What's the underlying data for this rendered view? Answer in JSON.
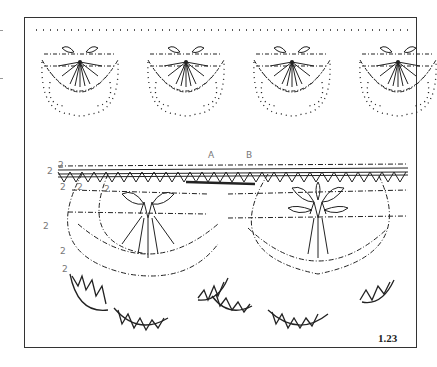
{
  "figure": {
    "number": "1.23"
  },
  "diagram": {
    "point_labels": [
      "A",
      "B"
    ],
    "pair_labels": [
      "2",
      "2",
      "2",
      "2",
      "2",
      "2",
      "2",
      "2"
    ],
    "motif_count_top": 4,
    "motif_count_bottom": 2
  },
  "colors": {
    "line": "#222222",
    "label": "#777777",
    "frame": "#333333"
  }
}
